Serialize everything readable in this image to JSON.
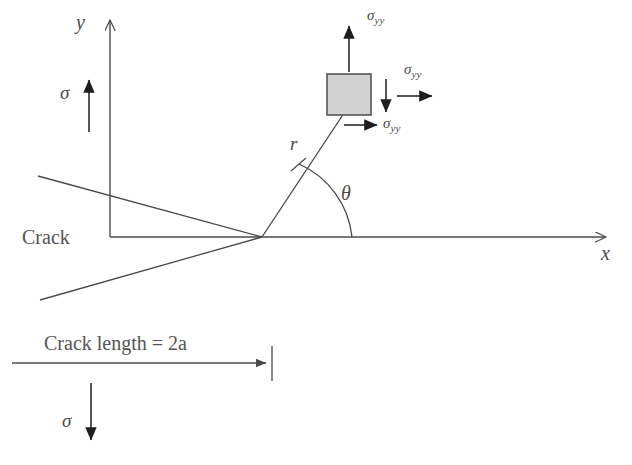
{
  "figure": {
    "background_color": "#ffffff",
    "line_color": "#4a4a4a",
    "element_fill_color": "#d2d2d2",
    "element_stroke_color": "#555555",
    "text_color": "#4a4a4a"
  },
  "axes": {
    "y_label": "y",
    "x_label": "x"
  },
  "labels": {
    "crack": "Crack",
    "crack_length": "Crack length = 2a",
    "radius": "r",
    "theta": "θ",
    "sigma_top": "σ",
    "sigma_bottom": "σ"
  },
  "stress_element": {
    "fill_color": "#d2d2d2",
    "stroke_color": "#555555",
    "arrows": [
      {
        "name": "sigma-yy-up",
        "symbol": "σ",
        "subscript": "yy",
        "direction": "up"
      },
      {
        "name": "sigma-yy-right",
        "symbol": "σ",
        "subscript": "yy",
        "direction": "right"
      },
      {
        "name": "sigma-yy-bottom-right",
        "symbol": "σ",
        "subscript": "yy",
        "direction": "right"
      },
      {
        "name": "sigma-yy-down",
        "symbol": "",
        "subscript": "",
        "direction": "down"
      }
    ]
  },
  "far_field_loads": [
    {
      "name": "sigma-tension-top",
      "symbol": "σ",
      "direction": "up"
    },
    {
      "name": "sigma-tension-bottom",
      "symbol": "σ",
      "direction": "down"
    }
  ]
}
